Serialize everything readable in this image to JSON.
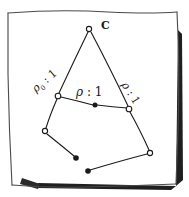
{
  "figure": {
    "kind": "hand-drawn-graph-sketch",
    "frame": {
      "border_color": "#555555",
      "shadow_color": "#1a1a1a",
      "paper_color": "#ffffff"
    },
    "ink_color": "#1a1a1a",
    "labels": {
      "apex": "C",
      "left_rho": "ρ",
      "left_sub": "0",
      "left_sep": " : ",
      "left_value": "1",
      "center_rho": "ρ",
      "center_sep": " : ",
      "center_value": "1",
      "right_rho": "ρ",
      "right_sep": " : ",
      "right_value": "1"
    },
    "nodes": [
      {
        "id": "apex",
        "name": "node-apex-c",
        "x": 89,
        "y": 29,
        "fill": "hollow"
      },
      {
        "id": "left",
        "name": "node-left-junction",
        "x": 58,
        "y": 96,
        "fill": "hollow"
      },
      {
        "id": "right",
        "name": "node-right-junction",
        "x": 129,
        "y": 109,
        "fill": "hollow"
      },
      {
        "id": "lower-left",
        "name": "node-lower-left",
        "x": 45,
        "y": 131,
        "fill": "hollow"
      },
      {
        "id": "lower-right",
        "name": "node-lower-right",
        "x": 150,
        "y": 153,
        "fill": "hollow"
      },
      {
        "id": "center-dot",
        "name": "node-center-filled",
        "x": 95,
        "y": 105,
        "fill": "solid"
      },
      {
        "id": "leaf-a",
        "name": "node-leaf-filled-a",
        "x": 76,
        "y": 158,
        "fill": "solid"
      },
      {
        "id": "leaf-b",
        "name": "node-leaf-filled-b",
        "x": 88,
        "y": 171,
        "fill": "solid"
      }
    ],
    "edges": [
      {
        "name": "edge-apex-left",
        "from": "apex",
        "to": "left"
      },
      {
        "name": "edge-apex-right",
        "from": "apex",
        "to": "right"
      },
      {
        "name": "edge-left-center",
        "from": "left",
        "to": "center-dot"
      },
      {
        "name": "edge-center-right",
        "from": "center-dot",
        "to": "right"
      },
      {
        "name": "edge-right-lowerright",
        "from": "right",
        "to": "lower-right"
      },
      {
        "name": "edge-left-lowerleft",
        "from": "left",
        "to": "lower-left"
      },
      {
        "name": "edge-lowerleft-leafa",
        "from": "lower-left",
        "to": "leaf-a"
      },
      {
        "name": "edge-leafb-lowerright",
        "from": "leaf-b",
        "to": "lower-right"
      }
    ]
  }
}
